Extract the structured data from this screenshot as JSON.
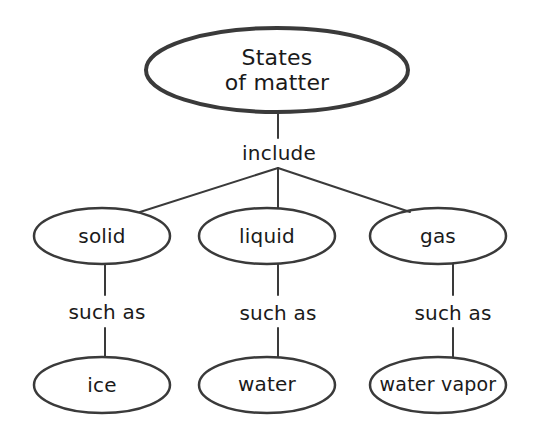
{
  "diagram": {
    "type": "concept-map",
    "root": {
      "label_line1": "States",
      "label_line2": "of matter"
    },
    "root_link": "include",
    "categories": [
      {
        "label": "solid",
        "link": "such as",
        "example": "ice"
      },
      {
        "label": "liquid",
        "link": "such as",
        "example": "water"
      },
      {
        "label": "gas",
        "link": "such as",
        "example": "water vapor"
      }
    ],
    "colors": {
      "stroke": "#3a3a3a",
      "text": "#1a1a1a",
      "background": "#ffffff"
    }
  }
}
